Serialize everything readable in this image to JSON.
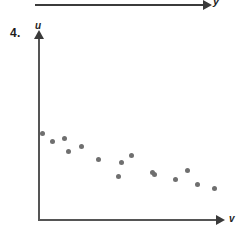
{
  "exercise": {
    "number_label": "4."
  },
  "previous_figure": {
    "axis_label": "y",
    "arrow_icon": "arrow-right-icon",
    "note": "cropped axis from preceding figure"
  },
  "plot": {
    "vertical_axis_label": "u",
    "horizontal_axis_label": "v",
    "vertical_arrow_icon": "arrow-up-icon",
    "horizontal_arrow_icon": "arrow-right-icon",
    "point_color": "#6f6f6f",
    "axis_color": "#555555"
  },
  "chart_data": {
    "type": "scatter",
    "title": "",
    "xlabel": "v",
    "ylabel": "u",
    "grid": false,
    "legend": "none",
    "xlim": [
      0,
      100
    ],
    "ylim": [
      0,
      100
    ],
    "n_points": 15,
    "trend": "negative",
    "x": [
      2,
      8,
      15,
      17,
      24,
      34,
      46,
      47,
      53,
      54,
      65,
      65,
      83,
      84,
      98
    ],
    "y": [
      50,
      41,
      44,
      30,
      36,
      32,
      35,
      41,
      22,
      18,
      26,
      9,
      30,
      14,
      6
    ],
    "pixel_points": [
      {
        "x": 42,
        "y": 133
      },
      {
        "x": 52,
        "y": 141
      },
      {
        "x": 64,
        "y": 138
      },
      {
        "x": 68,
        "y": 151
      },
      {
        "x": 81,
        "y": 146
      },
      {
        "x": 98,
        "y": 159
      },
      {
        "x": 118,
        "y": 176
      },
      {
        "x": 121,
        "y": 162
      },
      {
        "x": 131,
        "y": 155
      },
      {
        "x": 152,
        "y": 172
      },
      {
        "x": 154,
        "y": 174
      },
      {
        "x": 175,
        "y": 179
      },
      {
        "x": 187,
        "y": 170
      },
      {
        "x": 197,
        "y": 184
      },
      {
        "x": 214,
        "y": 188
      }
    ]
  }
}
